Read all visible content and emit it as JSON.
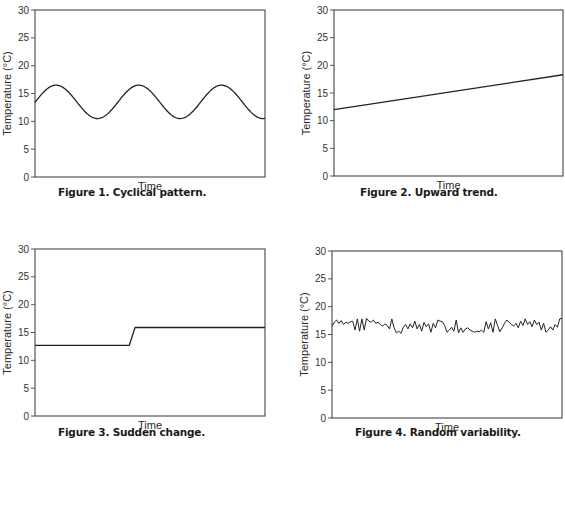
{
  "colors": {
    "frame": "#555555",
    "line": "#222222",
    "text": "#222222",
    "background": "#ffffff"
  },
  "chart_data": [
    {
      "id": "fig1",
      "type": "line",
      "title": "Figure 1. Cyclical pattern.",
      "xlabel": "Time",
      "ylabel": "Temperature (°C)",
      "ylim": [
        0,
        30
      ],
      "yticks": [
        0,
        5,
        10,
        15,
        20,
        25,
        30
      ],
      "grid": false,
      "legend": null,
      "pattern": "sine",
      "description": "Sinusoidal oscillation between ~10.5 and ~16.5 °C, 3 full peaks",
      "x": [
        0,
        0.05,
        0.1,
        0.15,
        0.2,
        0.25,
        0.3,
        0.35,
        0.4,
        0.45,
        0.5,
        0.55,
        0.6,
        0.65,
        0.7,
        0.75,
        0.8,
        0.85,
        0.9,
        0.95,
        1.0
      ],
      "values": [
        13.4,
        16.0,
        16.4,
        14.8,
        12.0,
        10.6,
        11.2,
        13.6,
        16.0,
        16.4,
        14.8,
        12.0,
        10.6,
        11.2,
        13.6,
        16.0,
        16.4,
        14.8,
        12.0,
        10.6,
        10.5
      ],
      "frame": {
        "x": 35,
        "y": 10,
        "w": 230,
        "h": 167
      },
      "caption_pos": {
        "x": 58,
        "y": 196
      }
    },
    {
      "id": "fig2",
      "type": "line",
      "title": "Figure 2. Upward trend.",
      "xlabel": "Time",
      "ylabel": "Temperature (°C)",
      "ylim": [
        0,
        30
      ],
      "yticks": [
        0,
        5,
        10,
        15,
        20,
        25,
        30
      ],
      "grid": false,
      "legend": null,
      "pattern": "linear",
      "description": "Straight line rising from ~12 °C to ~18.3 °C",
      "x": [
        0,
        1
      ],
      "values": [
        12.0,
        18.3
      ],
      "frame": {
        "x": 334,
        "y": 10,
        "w": 229,
        "h": 166
      },
      "caption_pos": {
        "x": 360,
        "y": 196
      }
    },
    {
      "id": "fig3",
      "type": "line",
      "title": "Figure 3. Sudden change.",
      "xlabel": "Time",
      "ylabel": "Temperature (°C)",
      "ylim": [
        0,
        30
      ],
      "yticks": [
        0,
        5,
        10,
        15,
        20,
        25,
        30
      ],
      "grid": false,
      "legend": null,
      "pattern": "step",
      "description": "Flat at ~12.7 °C, rapid rise near 41% of time to ~15.9 °C, flat after",
      "x": [
        0,
        0.41,
        0.435,
        1.0
      ],
      "values": [
        12.7,
        12.7,
        15.9,
        15.9
      ],
      "frame": {
        "x": 35,
        "y": 249,
        "w": 230,
        "h": 167
      },
      "caption_pos": {
        "x": 58,
        "y": 436
      }
    },
    {
      "id": "fig4",
      "type": "line",
      "title": "Figure 4. Random variability.",
      "xlabel": "Time",
      "ylabel": "Temperature (°C)",
      "ylim": [
        0,
        30
      ],
      "yticks": [
        0,
        5,
        10,
        15,
        20,
        25,
        30
      ],
      "grid": false,
      "legend": null,
      "pattern": "noise",
      "description": "Random fluctuation between ~15.2 and ~18 °C around a mean of ~16.5 °C",
      "x": [
        0.0,
        0.01,
        0.02,
        0.03,
        0.04,
        0.05,
        0.06,
        0.07,
        0.08,
        0.09,
        0.1,
        0.11,
        0.12,
        0.13,
        0.14,
        0.15,
        0.16,
        0.17,
        0.18,
        0.19,
        0.2,
        0.21,
        0.22,
        0.23,
        0.24,
        0.25,
        0.26,
        0.27,
        0.28,
        0.29,
        0.3,
        0.31,
        0.32,
        0.33,
        0.34,
        0.35,
        0.36,
        0.37,
        0.38,
        0.39,
        0.4,
        0.41,
        0.42,
        0.43,
        0.44,
        0.45,
        0.46,
        0.47,
        0.48,
        0.49,
        0.5,
        0.51,
        0.52,
        0.53,
        0.54,
        0.55,
        0.56,
        0.57,
        0.58,
        0.59,
        0.6,
        0.61,
        0.62,
        0.63,
        0.64,
        0.65,
        0.66,
        0.67,
        0.68,
        0.69,
        0.7,
        0.71,
        0.72,
        0.73,
        0.74,
        0.75,
        0.76,
        0.77,
        0.78,
        0.79,
        0.8,
        0.81,
        0.82,
        0.83,
        0.84,
        0.85,
        0.86,
        0.87,
        0.88,
        0.89,
        0.9,
        0.91,
        0.92,
        0.93,
        0.94,
        0.95,
        0.96,
        0.97,
        0.98,
        0.99,
        1.0
      ],
      "values": [
        16.5,
        17.2,
        17.6,
        17.0,
        17.5,
        16.8,
        17.2,
        17.0,
        17.3,
        17.4,
        15.8,
        17.8,
        15.6,
        17.8,
        15.8,
        17.9,
        17.4,
        17.2,
        17.6,
        17.0,
        17.2,
        16.8,
        16.5,
        16.9,
        16.6,
        16.0,
        17.8,
        16.2,
        15.3,
        15.6,
        15.2,
        16.3,
        16.8,
        16.0,
        16.9,
        16.2,
        17.4,
        16.0,
        16.8,
        15.6,
        17.2,
        16.4,
        16.9,
        15.4,
        17.0,
        16.2,
        17.6,
        17.4,
        17.3,
        16.6,
        15.4,
        15.8,
        16.3,
        15.6,
        17.6,
        15.3,
        16.2,
        15.4,
        16.0,
        16.2,
        15.8,
        15.6,
        15.4,
        15.6,
        15.5,
        15.8,
        15.4,
        17.3,
        16.0,
        17.1,
        15.4,
        17.8,
        16.6,
        15.5,
        16.2,
        17.0,
        17.6,
        17.2,
        16.8,
        16.5,
        17.0,
        16.2,
        17.4,
        16.6,
        17.8,
        16.8,
        17.3,
        16.4,
        17.6,
        16.8,
        17.2,
        15.8,
        17.0,
        15.4,
        15.8,
        16.4,
        15.8,
        16.8,
        16.3,
        17.8,
        17.9
      ],
      "frame": {
        "x": 332,
        "y": 251,
        "w": 230,
        "h": 167
      },
      "caption_pos": {
        "x": 355,
        "y": 436
      }
    }
  ]
}
